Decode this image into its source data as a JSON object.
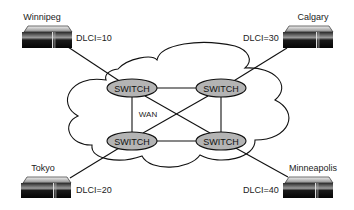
{
  "diagram": {
    "type": "frame-relay-network",
    "cloud": {
      "label": "WAN"
    },
    "switches": [
      {
        "id": "sw-tl",
        "label": "SWITCH",
        "cx": 132,
        "cy": 88
      },
      {
        "id": "sw-tr",
        "label": "SWITCH",
        "cx": 221,
        "cy": 88
      },
      {
        "id": "sw-bl",
        "label": "SWITCH",
        "cx": 132,
        "cy": 141
      },
      {
        "id": "sw-br",
        "label": "SWITCH",
        "cx": 221,
        "cy": 141
      }
    ],
    "sites": [
      {
        "id": "winnipeg",
        "name": "Winnipeg",
        "dlci": "DLCI=10",
        "switch": "sw-tl"
      },
      {
        "id": "calgary",
        "name": "Calgary",
        "dlci": "DLCI=30",
        "switch": "sw-tr"
      },
      {
        "id": "tokyo",
        "name": "Tokyo",
        "dlci": "DLCI=20",
        "switch": "sw-bl"
      },
      {
        "id": "minneapolis",
        "name": "Minneapolis",
        "dlci": "DLCI=40",
        "switch": "sw-br"
      }
    ],
    "links": [
      [
        "sw-tl",
        "sw-tr"
      ],
      [
        "sw-bl",
        "sw-br"
      ],
      [
        "sw-tl",
        "sw-bl"
      ],
      [
        "sw-tr",
        "sw-br"
      ],
      [
        "sw-tl",
        "sw-br"
      ],
      [
        "sw-tr",
        "sw-bl"
      ]
    ],
    "colors": {
      "switch_fill": "#b4b4b4",
      "line": "#111111",
      "router_body": "#111111",
      "router_top": "#c8c8c8"
    }
  }
}
